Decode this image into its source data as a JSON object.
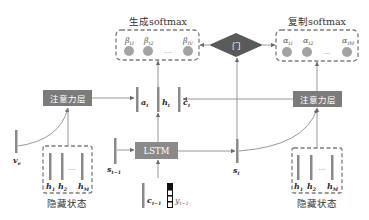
{
  "generate_softmax": {
    "title": "生成softmax",
    "labels": [
      {
        "sym": "β",
        "sub": "t1"
      },
      {
        "sym": "β",
        "sub": "t2"
      },
      {
        "sym": "β",
        "sub": "tV"
      }
    ],
    "ellipsis": "…"
  },
  "copy_softmax": {
    "title": "复制softmax",
    "labels": [
      {
        "sym": "α",
        "sub": "t1"
      },
      {
        "sym": "α",
        "sub": "t2"
      },
      {
        "sym": "α",
        "sub": "tM"
      }
    ],
    "ellipsis": "…"
  },
  "gate": {
    "label": "门"
  },
  "attention_left": {
    "label": "注意力层"
  },
  "attention_right": {
    "label": "注意力层"
  },
  "lstm": {
    "label": "LSTM"
  },
  "context_vectors": {
    "a": {
      "sym": "a",
      "sub": "t"
    },
    "h": {
      "sym": "h",
      "sub": "t"
    },
    "c": {
      "sym": "c",
      "sub": "t"
    }
  },
  "v_e": {
    "sym": "v",
    "sub": "e"
  },
  "s_prev": {
    "sym": "s",
    "sub": "t−1"
  },
  "s_t": {
    "sym": "s",
    "sub": "t"
  },
  "c_prev": {
    "sym": "c",
    "sub": "t−1"
  },
  "y_prev": {
    "sym": "y",
    "sub": "t−1"
  },
  "hidden_left": {
    "title": "隐藏状态",
    "labels": [
      {
        "sym": "h",
        "sub": "1"
      },
      {
        "sym": "h",
        "sub": "2"
      },
      {
        "sym": "h",
        "sub": "M"
      }
    ],
    "ellipsis": "…"
  },
  "hidden_right": {
    "title": "隐藏状态",
    "labels": [
      {
        "sym": "h",
        "sub": "1"
      },
      {
        "sym": "h",
        "sub": "2"
      },
      {
        "sym": "h",
        "sub": "M"
      }
    ],
    "ellipsis": "…"
  },
  "colors": {
    "attention_box": "#7b7b7b",
    "lstm_box": "#8a8a8a",
    "gate": "#5a5a5a",
    "bar": "#8a8a8a",
    "prob_dot": "#a3a3a3",
    "dashed_border": "#7c7c7c"
  }
}
